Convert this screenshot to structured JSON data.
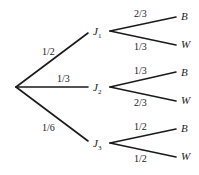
{
  "diagram": {
    "type": "probability-tree",
    "root": {
      "x": 16,
      "y": 87
    },
    "stage1": [
      {
        "node": "J",
        "sub": "1",
        "prob": "1/2",
        "x": 94,
        "y": 31
      },
      {
        "node": "J",
        "sub": "2",
        "prob": "1/3",
        "x": 94,
        "y": 87
      },
      {
        "node": "J",
        "sub": "3",
        "prob": "1/6",
        "x": 94,
        "y": 143
      }
    ],
    "stage2": [
      {
        "parent": "J1",
        "outcomes": [
          {
            "label": "B",
            "prob": "2/3"
          },
          {
            "label": "W",
            "prob": "1/3"
          }
        ]
      },
      {
        "parent": "J2",
        "outcomes": [
          {
            "label": "B",
            "prob": "1/3"
          },
          {
            "label": "W",
            "prob": "2/3"
          }
        ]
      },
      {
        "parent": "J3",
        "outcomes": [
          {
            "label": "B",
            "prob": "1/2"
          },
          {
            "label": "W",
            "prob": "1/2"
          }
        ]
      }
    ]
  }
}
